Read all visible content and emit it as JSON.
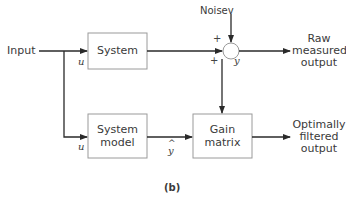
{
  "diagram": {
    "caption": "(b)",
    "input_label": "Input",
    "noise_label": "Noisev",
    "blocks": {
      "system": "System",
      "system_model_line1": "System",
      "system_model_line2": "model",
      "gain_line1": "Gain",
      "gain_line2": "matrix"
    },
    "signals": {
      "u_top": "u",
      "u_bottom": "u",
      "y": "y",
      "y_hat_caret": "^",
      "y_hat": "y",
      "plus_top": "+",
      "plus_left": "+"
    },
    "outputs": {
      "raw_line1": "Raw",
      "raw_line2": "measured",
      "raw_line3": "output",
      "filtered_line1": "Optimally",
      "filtered_line2": "filtered",
      "filtered_line3": "output"
    },
    "colors": {
      "line": "#2a2a2a",
      "box_border": "#9a9a9a"
    }
  }
}
